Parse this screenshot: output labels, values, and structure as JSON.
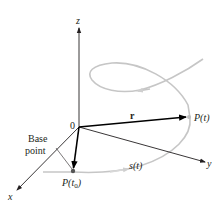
{
  "figure": {
    "type": "3d-space-curve-arc-length",
    "axes": {
      "x_label": "x",
      "y_label": "y",
      "z_label": "z",
      "origin_label": "0"
    },
    "vector_label": "r",
    "point_label": "P(t)",
    "base_point": {
      "label_line1": "Base",
      "label_line2": "point",
      "point_label_main": "P(t",
      "point_label_sub": "0",
      "point_label_close": ")"
    },
    "arc_length_label": "s(t)",
    "colors": {
      "axis": "#231f20",
      "vector": "#000000",
      "curve": "#bdbdbd",
      "point": "#555555"
    }
  }
}
